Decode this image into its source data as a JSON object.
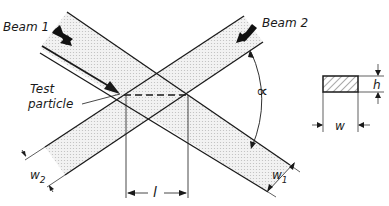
{
  "diagram": {
    "labels": {
      "beam1": "Beam 1",
      "beam2": "Beam 2",
      "test_particle_line1": "Test",
      "test_particle_line2": "particle",
      "angle": "∝",
      "width1": "w",
      "width1_sub": "1",
      "width2": "w",
      "width2_sub": "2",
      "length": "l",
      "cross_section_width": "w",
      "cross_section_height": "h"
    },
    "colors": {
      "line": "#1a1a1a",
      "beam_fill": "#e6e6e6",
      "background": "#ffffff"
    }
  }
}
